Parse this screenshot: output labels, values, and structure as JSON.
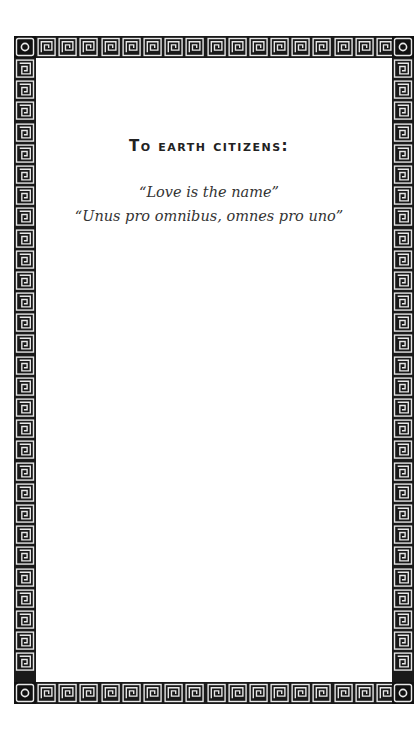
{
  "page": {
    "heading": "To earth citizens:",
    "quotes": [
      "“Love is the name”",
      "“Unus pro omnibus, omnes pro uno”"
    ]
  },
  "border": {
    "style": "greek-key-meander",
    "corner_icon": "circle-in-square",
    "band_color": "#1a1a1a",
    "pattern_color": "#e8e8e8"
  }
}
